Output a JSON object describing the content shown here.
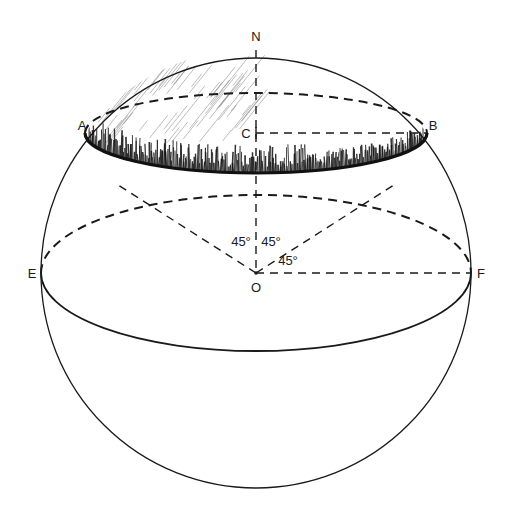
{
  "figure": {
    "colors": {
      "ink": "#1a1a1a",
      "background": "#ffffff",
      "shading": "#111111"
    },
    "points": {
      "N": "N",
      "A": "A",
      "B": "B",
      "C": "C",
      "O": "O",
      "E": "E",
      "F": "F"
    },
    "angles": [
      {
        "label": "45°",
        "between": "OA and ON"
      },
      {
        "label": "45°",
        "between": "ON and OB"
      },
      {
        "label": "45°",
        "between": "OB and OF"
      }
    ]
  }
}
